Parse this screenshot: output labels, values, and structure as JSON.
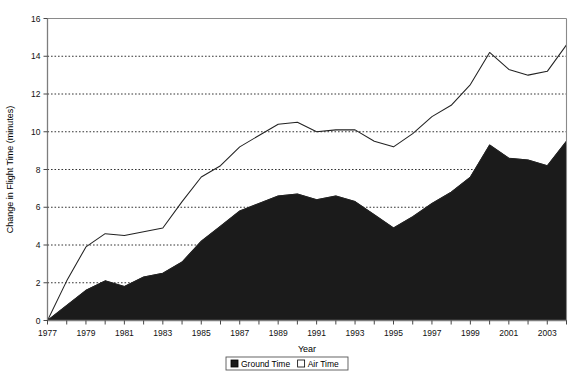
{
  "chart_data": {
    "type": "area",
    "title": "",
    "xlabel": "Year",
    "ylabel": "Change in Flight Time (minutes)",
    "x": [
      1977,
      1978,
      1979,
      1980,
      1981,
      1982,
      1983,
      1984,
      1985,
      1986,
      1987,
      1988,
      1989,
      1990,
      1991,
      1992,
      1993,
      1994,
      1995,
      1996,
      1997,
      1998,
      1999,
      2000,
      2001,
      2002,
      2003,
      2004
    ],
    "xlim": [
      1977,
      2004
    ],
    "ylim": [
      0,
      16
    ],
    "yticks": [
      0,
      2,
      4,
      6,
      8,
      10,
      12,
      14,
      16
    ],
    "xticks": [
      1977,
      1979,
      1981,
      1983,
      1985,
      1987,
      1989,
      1991,
      1993,
      1995,
      1997,
      1999,
      2001,
      2003
    ],
    "xtick_labels": [
      "1977",
      "1979",
      "1981",
      "1983",
      "1985",
      "1987",
      "1989",
      "1991",
      "1993",
      "1995",
      "1997",
      "1999",
      "2001",
      "2003"
    ],
    "ytick_labels": [
      "0",
      "2",
      "4",
      "6",
      "8",
      "10",
      "12",
      "14",
      "16"
    ],
    "grid": true,
    "grid_axis": "y",
    "stacked": true,
    "legend_position": "bottom",
    "series": [
      {
        "name": "Ground Time",
        "color": "#1b1b1b",
        "values": [
          0.0,
          0.8,
          1.6,
          2.1,
          1.8,
          2.3,
          2.5,
          3.1,
          4.2,
          5.0,
          5.8,
          6.2,
          6.6,
          6.7,
          6.4,
          6.6,
          6.3,
          5.6,
          4.9,
          5.5,
          6.2,
          6.8,
          7.6,
          9.3,
          8.6,
          8.5,
          8.2,
          9.5
        ]
      },
      {
        "name": "Air Time",
        "color": "#ffffff",
        "values": [
          0.0,
          1.3,
          2.3,
          2.5,
          2.7,
          2.4,
          2.4,
          3.2,
          3.4,
          3.2,
          3.4,
          3.6,
          3.8,
          3.8,
          3.6,
          3.5,
          3.8,
          3.9,
          4.3,
          4.4,
          4.6,
          4.6,
          4.9,
          4.9,
          4.7,
          4.5,
          5.0,
          5.1
        ]
      }
    ],
    "total_values": [
      0.0,
      2.1,
      3.9,
      4.6,
      4.5,
      4.7,
      4.9,
      6.3,
      7.6,
      8.2,
      9.2,
      9.8,
      10.4,
      10.5,
      10.0,
      10.1,
      10.1,
      9.5,
      9.2,
      9.9,
      10.8,
      11.4,
      12.5,
      14.2,
      13.3,
      13.0,
      13.2,
      14.6
    ]
  },
  "legend": {
    "items": [
      {
        "label": "Ground Time",
        "swatch": "filled-black"
      },
      {
        "label": "Air Time",
        "swatch": "open-white"
      }
    ]
  }
}
